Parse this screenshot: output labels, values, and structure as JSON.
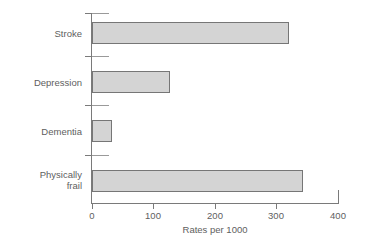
{
  "chart_data": {
    "type": "bar",
    "orientation": "horizontal",
    "title": "",
    "xlabel": "Rates per 1000",
    "ylabel": "DoH priority group",
    "categories": [
      "Stroke",
      "Depression",
      "Dementia",
      "Physically\nfrail"
    ],
    "values": [
      320,
      127,
      33,
      343
    ],
    "xlim": [
      0,
      400
    ],
    "xticks": [
      0,
      100,
      200,
      300,
      400
    ],
    "xtick_labels": [
      "0",
      "100",
      "200",
      "300",
      "400"
    ],
    "grid": false,
    "legend": null,
    "bar_fill_color": "#d4d4d4",
    "bar_border_color": "#767676",
    "axis_color": "#7a7a7a",
    "text_color": "#606060"
  },
  "axes": {
    "y_title": "DoH priority group",
    "x_title": "Rates per 1000"
  },
  "categories": {
    "c0": "Stroke",
    "c1": "Depression",
    "c2": "Dementia",
    "c3": "Physically\nfrail"
  },
  "xticks": {
    "t0": "0",
    "t1": "100",
    "t2": "200",
    "t3": "300",
    "t4": "400"
  }
}
